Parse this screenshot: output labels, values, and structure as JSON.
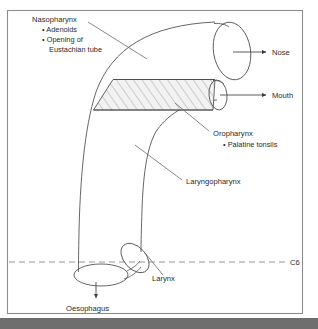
{
  "figure": {
    "frame": {
      "border_color": "#8d8d8d",
      "background": "#ffffff"
    },
    "bottom_bar": {
      "color": "#6e6e6e"
    },
    "colors": {
      "outline": "#4a4a4a",
      "leader": "#6a6a6a",
      "hatch_fill": "#f0f0f0",
      "hatch_stroke": "#9a9a9a",
      "dashed_line": "#8a8a8a",
      "text": "#2a2a2a"
    }
  },
  "labels": {
    "nasopharynx": {
      "heading": "Nasopharynx",
      "bullets": [
        "• Adenoids",
        "• Opening of",
        "Eustachian tube"
      ]
    },
    "nose": "Nose",
    "mouth": "Mouth",
    "oropharynx": {
      "heading": "Oropharynx",
      "bullets": [
        "• Palatine tonsils"
      ]
    },
    "laryngopharynx": "Laryngopharynx",
    "larynx": "Larynx",
    "oesophagus": "Oesophagus",
    "vertebral_level": "C6"
  }
}
